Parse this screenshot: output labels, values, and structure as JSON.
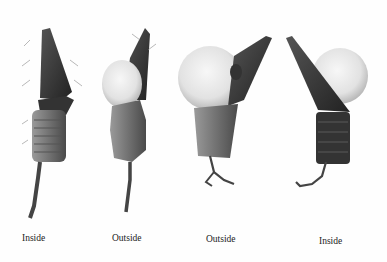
{
  "figure": {
    "labels": [
      "Inside",
      "Outside",
      "Outside",
      "Inside"
    ],
    "colors": {
      "background": "#fefefe",
      "ink_dark": "#2a2a2a",
      "ink_mid": "#6a6a6a",
      "pollen": "#ececec",
      "label": "#222222"
    }
  }
}
